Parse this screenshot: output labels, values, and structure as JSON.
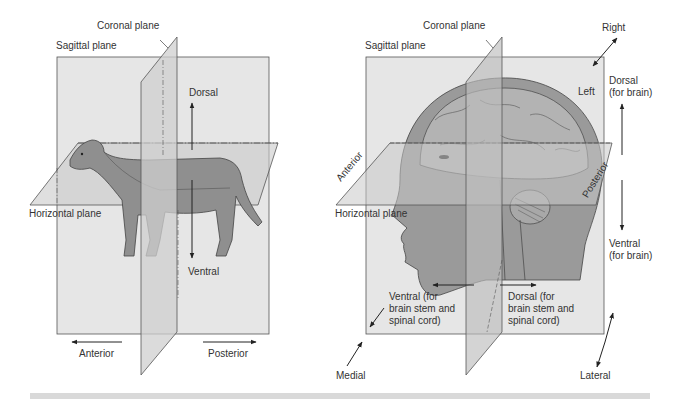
{
  "left_panel": {
    "labels": {
      "coronal": "Coronal plane",
      "sagittal": "Sagittal plane",
      "horizontal": "Horizontal plane",
      "dorsal": "Dorsal",
      "ventral": "Ventral",
      "anterior": "Anterior",
      "posterior": "Posterior"
    },
    "subject": "dog"
  },
  "right_panel": {
    "labels": {
      "coronal": "Coronal plane",
      "sagittal": "Sagittal plane",
      "horizontal": "Horizontal plane",
      "right": "Right",
      "left": "Left",
      "dorsal_brain": "Dorsal\n(for brain)",
      "ventral_brain": "Ventral\n(for brain)",
      "anterior": "Anterior",
      "posterior": "Posterior",
      "ventral_stem": "Ventral (for\nbrain stem and\nspinal cord)",
      "dorsal_stem": "Dorsal (for\nbrain stem and\nspinal cord)",
      "medial": "Medial",
      "lateral": "Lateral"
    },
    "subject": "human head"
  },
  "colors": {
    "plane_fill": "#e4e4e4",
    "plane_stroke": "#555555",
    "subject_fill": "#8f8f8f",
    "subject_dark": "#6e6e6e",
    "footer_bar": "#d9d9d9"
  }
}
